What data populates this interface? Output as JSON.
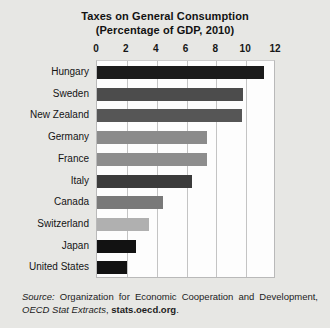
{
  "chart_data": {
    "type": "bar",
    "orientation": "horizontal",
    "title": "Taxes on General Consumption",
    "subtitle": "(Percentage of GDP, 2010)",
    "xlabel": "",
    "ylabel": "",
    "xlim": [
      0,
      12
    ],
    "xticks": [
      0,
      2,
      4,
      6,
      8,
      10,
      12
    ],
    "xtick_labels": [
      "0",
      "2",
      "4",
      "6",
      "8",
      "10",
      "12"
    ],
    "grid": true,
    "legend": false,
    "categories": [
      "Hungary",
      "Sweden",
      "New Zealand",
      "Germany",
      "France",
      "Italy",
      "Canada",
      "Switzerland",
      "Japan",
      "United States"
    ],
    "values": [
      11.2,
      9.8,
      9.7,
      7.4,
      7.4,
      6.4,
      4.4,
      3.5,
      2.6,
      2.0
    ],
    "bar_colors": [
      "#1b1b1b",
      "#4c4c4c",
      "#565656",
      "#8b8b8b",
      "#8d8d8d",
      "#3b3b3b",
      "#797979",
      "#b0b0b0",
      "#121212",
      "#121212"
    ]
  },
  "source_note": {
    "label": "Source:",
    "organization": " Organization for Economic Cooperation and Development, ",
    "publication": "OECD Stat Extracts",
    "separator": ", ",
    "url": "stats.oecd.org",
    "period": "."
  },
  "colors": {
    "page_background": "#e7e7e4",
    "plot_background": "#fdfdfd",
    "gridline": "#c4c4c4",
    "text": "#141414"
  }
}
